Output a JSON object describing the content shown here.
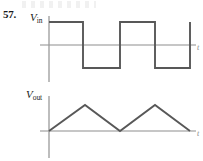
{
  "figure": {
    "problem_number": "57.",
    "time_axis_label": "t",
    "stroke_color": "#585858",
    "axis_color": "#8d8d8d",
    "background_color": "#ffffff"
  },
  "plots": [
    {
      "id": "vin",
      "label_main": "V",
      "label_sub": "in",
      "axis_label_y": "V_in",
      "axis_label_x": "t",
      "origin": {
        "x": 49,
        "y": 45
      },
      "x_axis": {
        "x1": 40,
        "y1": 45,
        "x2": 196,
        "y2": 45
      },
      "y_axis": {
        "x1": 49,
        "y1": 16,
        "x2": 49,
        "y2": 82
      },
      "chart_data": {
        "type": "line",
        "waveform": "square",
        "title": "V_in",
        "xlabel": "t",
        "ylabel": "V_in",
        "amplitude_high_y": 22,
        "amplitude_low_y": 68,
        "zero_y": 45,
        "duty_cycle_percent": 50,
        "levels": [
          1,
          -1,
          1,
          -1,
          1
        ],
        "transition_x": [
          49,
          83,
          120,
          155,
          190
        ],
        "points": [
          [
            49,
            22
          ],
          [
            83,
            22
          ],
          [
            83,
            68
          ],
          [
            120,
            68
          ],
          [
            120,
            22
          ],
          [
            155,
            22
          ],
          [
            155,
            68
          ],
          [
            190,
            68
          ],
          [
            190,
            22
          ]
        ],
        "grid": false,
        "legend": false
      }
    },
    {
      "id": "vout",
      "label_main": "V",
      "label_sub": "out",
      "axis_label_y": "V_out",
      "axis_label_x": "t",
      "origin": {
        "x": 49,
        "y": 131
      },
      "x_axis": {
        "x1": 40,
        "y1": 131,
        "x2": 196,
        "y2": 131
      },
      "y_axis": {
        "x1": 49,
        "y1": 96,
        "x2": 49,
        "y2": 158
      },
      "chart_data": {
        "type": "line",
        "waveform": "triangular",
        "title": "V_out",
        "xlabel": "t",
        "ylabel": "V_out",
        "peak_y": 105,
        "zero_y": 131,
        "peaks_x": [
          85,
          155
        ],
        "valleys_x": [
          49,
          120,
          190
        ],
        "points": [
          [
            49,
            131
          ],
          [
            85,
            105
          ],
          [
            120,
            131
          ],
          [
            155,
            105
          ],
          [
            190,
            131
          ]
        ],
        "grid": false,
        "legend": false
      }
    }
  ]
}
